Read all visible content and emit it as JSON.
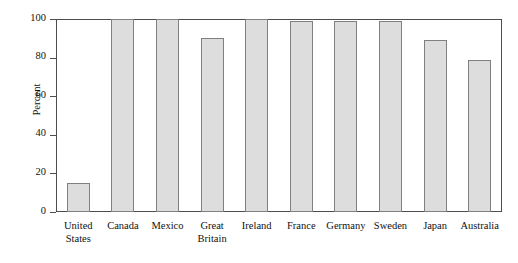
{
  "chart_data": {
    "type": "bar",
    "title": "",
    "subtitle": "",
    "xlabel": "",
    "ylabel": "Percent",
    "categories": [
      "United States",
      "Canada",
      "Mexico",
      "Great Britain",
      "Ireland",
      "France",
      "Germany",
      "Sweden",
      "Japan",
      "Australia"
    ],
    "category_lines": [
      [
        "United",
        "States"
      ],
      [
        "Canada"
      ],
      [
        "Mexico"
      ],
      [
        "Great",
        "Britain"
      ],
      [
        "Ireland"
      ],
      [
        "France"
      ],
      [
        "Germany"
      ],
      [
        "Sweden"
      ],
      [
        "Japan"
      ],
      [
        "Australia"
      ]
    ],
    "values": [
      15,
      100,
      100,
      90,
      100,
      99,
      99,
      99,
      89,
      79
    ],
    "ylim": [
      0,
      100
    ],
    "yticks": [
      0,
      20,
      40,
      60,
      80,
      100
    ],
    "ytick_labels": [
      "0",
      "20",
      "40",
      "60",
      "80",
      "100"
    ],
    "grid": false,
    "legend": null,
    "legend_position": "none",
    "bar_fill_color": "#dddddd",
    "bar_edge_color": "#808080",
    "axis_color": "#4d4d4d",
    "background_color": "#ffffff"
  }
}
